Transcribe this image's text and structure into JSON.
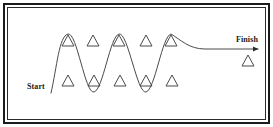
{
  "figure": {
    "name": "slalom-course-diagram",
    "type": "diagram",
    "background_color": "#ffffff",
    "line_color": "#4a4a4a",
    "border_color": "#1b1b1b",
    "text_color": "#1a1a1a",
    "width": 273,
    "height": 127
  },
  "labels": {
    "start": "Start",
    "finish": "Finish"
  },
  "path": {
    "name": "weaving-path",
    "description": "sinusoidal slalom path from start to finish",
    "stroke_width": 1,
    "start_point": [
      51,
      93
    ],
    "end_point": [
      258,
      49
    ],
    "peaks_x": [
      68,
      119,
      171
    ],
    "troughs_x": [
      94,
      146
    ],
    "peak_y": 34,
    "trough_y": 92,
    "flat_y": 49,
    "arrowhead": true
  },
  "cones": {
    "top_row": {
      "count": 5,
      "y": 46,
      "x": [
        68,
        93,
        119,
        146,
        171
      ]
    },
    "bottom_row": {
      "count": 5,
      "y": 86,
      "x": [
        68,
        94,
        120,
        146,
        172
      ]
    },
    "finish_cone": {
      "count": 1,
      "x": 248,
      "y": 66
    },
    "size": {
      "half_width": 6,
      "height": 11
    }
  }
}
